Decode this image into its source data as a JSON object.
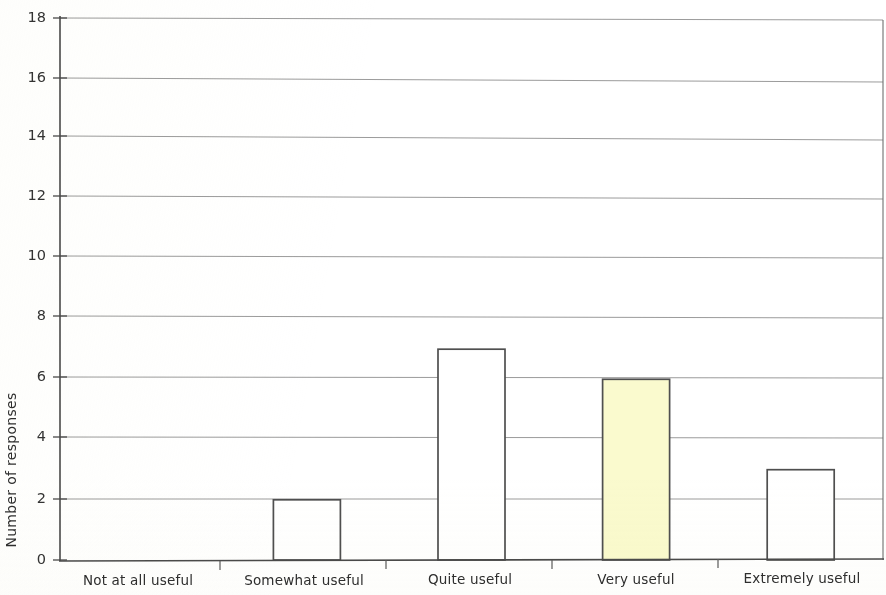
{
  "chart_data": {
    "type": "bar",
    "title": "",
    "subtitle": "",
    "xlabel": "",
    "ylabel": "Number of responses",
    "categories": [
      "Not at all useful",
      "Somewhat useful",
      "Quite useful",
      "Very useful",
      "Extremely useful"
    ],
    "values": [
      0,
      2,
      7,
      6,
      3
    ],
    "ylim": [
      0,
      18
    ],
    "yticks": [
      0,
      2,
      4,
      6,
      8,
      10,
      12,
      14,
      16,
      18
    ],
    "ytick_labels": [
      "0",
      "2",
      "4",
      "6",
      "8",
      "10",
      "12",
      "14",
      "16",
      "18"
    ],
    "grid": true,
    "grid_axis": "y",
    "legend": null,
    "legend_position": "none",
    "bar_colors": [
      "#ffffff",
      "#ffffff",
      "#ffffff",
      "#faface",
      "#ffffff"
    ],
    "bar_edge_color": "#4f4f4f",
    "highlighted_category": "Very useful",
    "annotations": []
  },
  "axes": {
    "y_title": "Number of responses",
    "y_tick_values": [
      "0",
      "2",
      "4",
      "6",
      "8",
      "10",
      "12",
      "14",
      "16",
      "18"
    ],
    "x_tick_values": [
      "Not at all useful",
      "Somewhat useful",
      "Quite useful",
      "Very useful",
      "Extremely useful"
    ]
  },
  "colors": {
    "grid": "#7c7c7c",
    "axis": "#4a4a4a",
    "bar_fill_default": "#ffffff",
    "bar_fill_highlight": "#faface",
    "bar_stroke": "#4f4f4f",
    "text": "#2e2e2e",
    "background": "#ffffff"
  }
}
